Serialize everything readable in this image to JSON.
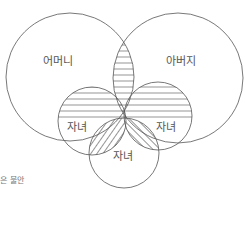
{
  "diagram": {
    "type": "venn",
    "title": "",
    "sets": [
      {
        "id": "mother",
        "label": "어머니",
        "cx": 70,
        "cy": 77,
        "r": 64
      },
      {
        "id": "father",
        "label": "아버지",
        "cx": 178,
        "cy": 78,
        "r": 65
      },
      {
        "id": "child_left",
        "label": "자녀",
        "cx": 92,
        "cy": 121,
        "r": 34
      },
      {
        "id": "child_right",
        "label": "자녀",
        "cx": 158,
        "cy": 116,
        "r": 34
      },
      {
        "id": "child_bottom",
        "label": "자녀",
        "cx": 124,
        "cy": 153,
        "r": 35
      }
    ],
    "hatched_regions": [
      {
        "region": "mother ∩ father",
        "pattern": "horizontal"
      },
      {
        "region": "child_left (upper, within mother)",
        "pattern": "horizontal"
      },
      {
        "region": "child_right (upper, within father)",
        "pattern": "horizontal"
      },
      {
        "region": "child_left ∩ child_bottom",
        "pattern": "diagonal-forward"
      },
      {
        "region": "child_right ∩ child_bottom",
        "pattern": "diagonal-backward"
      }
    ],
    "caption": "은 불안"
  },
  "colors": {
    "stroke": "#555555",
    "hatch": "#666666",
    "background": "#ffffff",
    "text": "#555555"
  }
}
